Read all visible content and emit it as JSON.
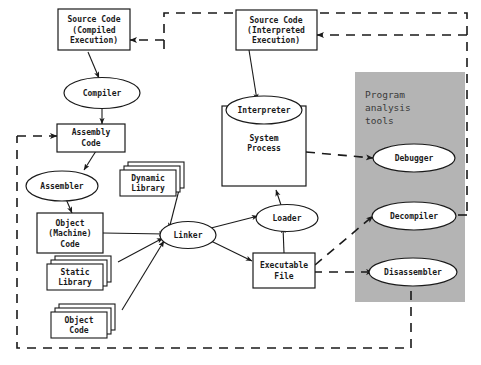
{
  "diagram": {
    "panel": {
      "label_line1": "Program",
      "label_line2": "analysis",
      "label_line3": "tools",
      "color": "#b4b4b4"
    },
    "nodes": {
      "source_compiled": {
        "line1": "Source Code",
        "line2": "(Compiled",
        "line3": "Execution)"
      },
      "compiler": {
        "line1": "Compiler"
      },
      "assembly_code": {
        "line1": "Assembly",
        "line2": "Code"
      },
      "assembler": {
        "line1": "Assembler"
      },
      "object_machine_code": {
        "line1": "Object",
        "line2": "(Machine)",
        "line3": "Code"
      },
      "dynamic_library": {
        "line1": "Dynamic",
        "line2": "Library"
      },
      "static_library": {
        "line1": "Static",
        "line2": "Library"
      },
      "object_code": {
        "line1": "Object",
        "line2": "Code"
      },
      "linker": {
        "line1": "Linker"
      },
      "source_interpreted": {
        "line1": "Source Code",
        "line2": "(Interpreted",
        "line3": "Execution)"
      },
      "interpreter": {
        "line1": "Interpreter"
      },
      "system_process": {
        "line1": "System",
        "line2": "Process"
      },
      "loader": {
        "line1": "Loader"
      },
      "executable_file": {
        "line1": "Executable",
        "line2": "File"
      },
      "debugger": {
        "line1": "Debugger"
      },
      "decompiler": {
        "line1": "Decompiler"
      },
      "disassembler": {
        "line1": "Disassembler"
      }
    },
    "colors": {
      "stroke": "#1a1a1a",
      "node_fill": "#ffffff",
      "panel_fill": "#b4b4b4",
      "background": "#ffffff"
    }
  }
}
